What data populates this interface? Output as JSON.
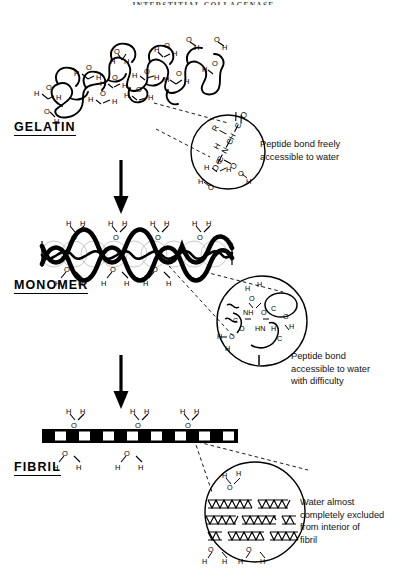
{
  "running_head": "INTERSTITIAL COLLAGENASE",
  "stages": [
    {
      "id": "gelatin",
      "label": "GELATIN",
      "label_x": 14,
      "label_y": 128,
      "caption": "Peptide bond freely\naccessible to water",
      "caption_x": 260,
      "caption_y": 128,
      "inset": {
        "cx": 228,
        "cy": 152,
        "r": 38
      },
      "structure": "random-coil",
      "water_count": 14
    },
    {
      "id": "monomer",
      "label": "MONOMER",
      "label_x": 14,
      "label_y": 286,
      "caption": "Peptide bond\n  accessible to water\n  with difficulty",
      "caption_x": 291,
      "caption_y": 350,
      "inset": {
        "cx": 281,
        "cy": 318,
        "r": 47
      },
      "structure": "triple-helix",
      "water_top_count": 4,
      "water_bottom_count": 3
    },
    {
      "id": "fibril",
      "label": "FIBRIL",
      "label_x": 14,
      "label_y": 468,
      "caption": "Water almost\n  completely excluded\n  from interior of\n  fibril",
      "caption_x": 300,
      "caption_y": 496,
      "inset": {
        "cx": 255,
        "cy": 512,
        "r": 52
      },
      "structure": "banded-fibril",
      "water_top_count": 3,
      "water_bottom_count": 3
    }
  ],
  "arrows": [
    {
      "id": "gelatin-to-monomer",
      "x": 120,
      "y_top": 163,
      "y_bottom": 213
    },
    {
      "id": "monomer-to-fibril",
      "x": 120,
      "y_top": 358,
      "y_bottom": 408
    }
  ],
  "molecule_labels": {
    "hydrogen": "H",
    "oxygen": "O",
    "nitrogen": "N",
    "carbon": "C",
    "side_chain": "R",
    "amide": "NH"
  },
  "colors": {
    "ink": "#000000",
    "paper": "#ffffff",
    "ghost": "#c9c9c9",
    "runhead": "#4a4a4a"
  },
  "chemistry": {
    "gelatin_inset_atoms": [
      "O",
      "C",
      "N",
      "H",
      "C",
      "H",
      "R",
      "C",
      "O"
    ],
    "gelatin_inset_waters": 3,
    "monomer_inset_groups": [
      "NH",
      "C=O",
      "O",
      "H–O–H"
    ],
    "monomer_inset_waters": 4,
    "fibril_inset_waters_outside": 4,
    "fibril_inset_helix_rows": 3
  }
}
